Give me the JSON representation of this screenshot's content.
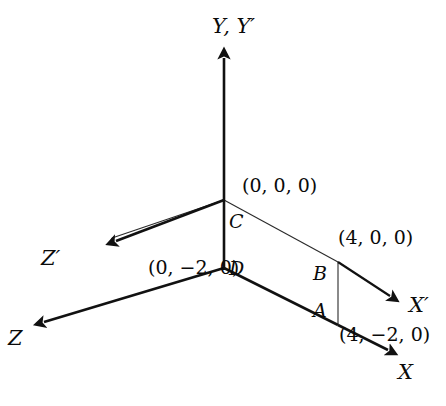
{
  "figure": {
    "kind": "3d-coordinate-axes-diagram",
    "background_color": "#ffffff",
    "stroke_color": "#111111"
  },
  "axes": [
    {
      "id": "y-axis",
      "label": "Y, Y′",
      "direction": "up"
    },
    {
      "id": "z-prime-axis",
      "label": "Z′",
      "direction": "up-left"
    },
    {
      "id": "z-axis",
      "label": "Z",
      "direction": "down-left"
    },
    {
      "id": "x-prime-axis",
      "label": "X′",
      "direction": "down-right"
    },
    {
      "id": "x-axis",
      "label": "X",
      "direction": "down-right"
    }
  ],
  "points": [
    {
      "id": "point-c",
      "label": "C",
      "coordinate": "(0, 0, 0)"
    },
    {
      "id": "point-d",
      "label": "D",
      "coordinate": "(0, −2, 0)"
    },
    {
      "id": "point-b",
      "label": "B",
      "coordinate": "(4, 0, 0)"
    },
    {
      "id": "point-a",
      "label": "A",
      "coordinate": "(4, −2, 0)"
    }
  ],
  "labels": {
    "y_axis": "Y, Y′",
    "z_prime_axis": "Z′",
    "z_axis": "Z",
    "x_prime_axis": "X′",
    "x_axis": "X",
    "point_c": "C",
    "point_d": "D",
    "point_b": "B",
    "point_a": "A",
    "origin_coord": "(0, 0, 0)",
    "d_coord": "(0, −2, 0)",
    "b_coord": "(4, 0, 0)",
    "a_coord": "(4, −2, 0)"
  }
}
